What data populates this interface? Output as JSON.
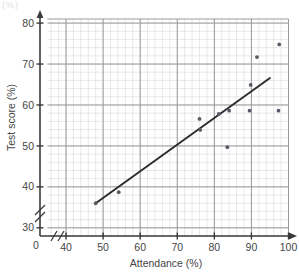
{
  "chart_data": {
    "type": "scatter",
    "title": "",
    "xlabel": "Attendance (%)",
    "ylabel": "Test score (%)",
    "xlim": [
      35,
      100
    ],
    "ylim": [
      28,
      81
    ],
    "xticks": [
      40,
      50,
      60,
      70,
      80,
      90,
      100
    ],
    "yticks": [
      30,
      40,
      50,
      60,
      70,
      80
    ],
    "origin_label": "0",
    "grid": true,
    "grid_minor": true,
    "axis_break_x": true,
    "axis_break_y": true,
    "legend": "none",
    "points": [
      {
        "x": 48.0,
        "y": 36.0
      },
      {
        "x": 54.2,
        "y": 38.7
      },
      {
        "x": 76.0,
        "y": 56.6
      },
      {
        "x": 76.2,
        "y": 53.9
      },
      {
        "x": 81.2,
        "y": 57.8
      },
      {
        "x": 83.5,
        "y": 49.7
      },
      {
        "x": 84.0,
        "y": 58.6
      },
      {
        "x": 89.5,
        "y": 58.6
      },
      {
        "x": 89.8,
        "y": 64.9
      },
      {
        "x": 91.5,
        "y": 71.7
      },
      {
        "x": 97.3,
        "y": 58.6
      },
      {
        "x": 97.5,
        "y": 74.8
      }
    ],
    "trend_line": {
      "x_start": 48.0,
      "y_start": 36.0,
      "x_end": 95.0,
      "y_end": 66.6
    },
    "marker": "dot",
    "marker_color": "#5a5a66",
    "line_color": "#2b2b2b",
    "grid_major_color": "#9a9a9a",
    "grid_minor_color": "#d8d8d8",
    "axis_color": "#3a3a3a"
  },
  "figure": {
    "ghost_fragment": "(%)"
  }
}
